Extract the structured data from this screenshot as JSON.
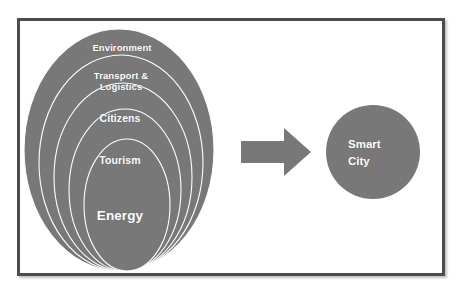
{
  "figure": {
    "background_color": "#ffffff",
    "frame_color": "#4c4c4c",
    "shape_fill_color": "#787878",
    "shape_outline_color": "#ffffff",
    "label_color": "#ffffff"
  },
  "nested_rings": [
    {
      "id": "environment",
      "label": "Environment"
    },
    {
      "id": "transport-logistics",
      "label": "Transport &\nLogistics"
    },
    {
      "id": "citizens",
      "label": "Citizens"
    },
    {
      "id": "tourism",
      "label": "Tourism"
    },
    {
      "id": "energy",
      "label": "Energy"
    }
  ],
  "connector": {
    "type": "right-arrow",
    "label": ""
  },
  "result_node": {
    "id": "smart-city",
    "label": "Smart\nCity"
  }
}
